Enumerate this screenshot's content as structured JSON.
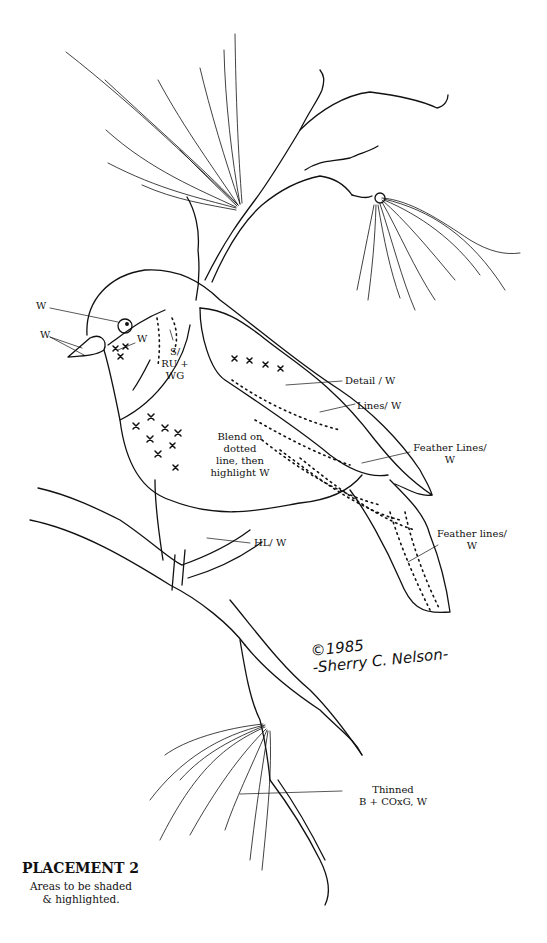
{
  "title": "PLACEMENT 2",
  "subtitle_lines": [
    "Areas to be shaded",
    "& highlighted."
  ],
  "signature": {
    "copyright": "©1985",
    "name": "-Sherry C. Nelson-"
  },
  "labels": {
    "eye": "W",
    "beak": "W",
    "cheek": "W",
    "neck": [
      "S/",
      "RU +",
      "WG"
    ],
    "breast": [
      "Blend on",
      "dotted",
      "line, then",
      "highlight W"
    ],
    "wing_detail": "Detail / W",
    "wing_lines": "Lines/ W",
    "primary_feathers": [
      "Feather Lines/",
      "W"
    ],
    "tail_feathers": [
      "Feather lines/",
      "W"
    ],
    "foot": "HL/ W",
    "pine_needles": [
      "Thinned",
      "B + COxG, W"
    ]
  },
  "colors": {
    "ink": "#111111",
    "paper": "#ffffff"
  }
}
